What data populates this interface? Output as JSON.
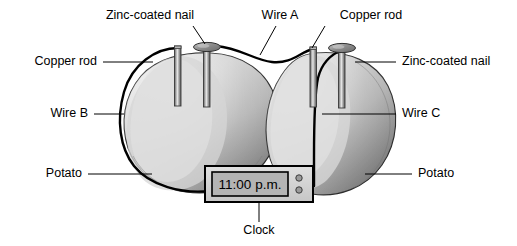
{
  "figure": {
    "background_color": "#ffffff"
  },
  "labels": {
    "zinc_nail_top": "Zinc-coated nail",
    "wire_a": "Wire A",
    "copper_rod_top": "Copper rod",
    "copper_rod_left": "Copper rod",
    "zinc_nail_right": "Zinc-coated nail",
    "wire_b": "Wire B",
    "wire_c": "Wire C",
    "potato_left": "Potato",
    "potato_right": "Potato",
    "clock": "Clock"
  },
  "clock": {
    "display_value": "11:00 p.m.",
    "display_bg": "#b4b4b4",
    "body_bg": "#d2d2d2",
    "button_count": 2
  },
  "colors": {
    "potato_light": "#d8d8d8",
    "potato_mid": "#b0b0b0",
    "potato_dark": "#6e6e6e",
    "metal_light": "#e2e2e2",
    "metal_mid": "#9a9a9a",
    "metal_dark": "#5a5a5a",
    "wire_stroke": "#000000",
    "outline": "#2b2b2b",
    "text": "#000000"
  },
  "components": {
    "potatoes": 2,
    "copper_rods": 2,
    "zinc_nails": 2,
    "wires": [
      "Wire A",
      "Wire B",
      "Wire C"
    ]
  }
}
